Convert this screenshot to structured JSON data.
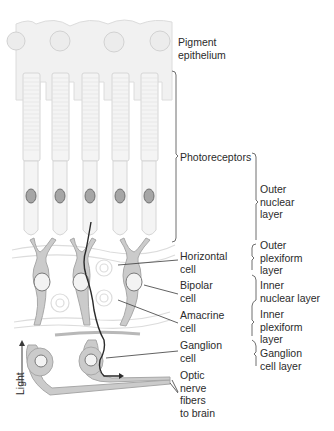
{
  "figure": {
    "type": "retina-cross-section",
    "colors": {
      "cell_fill_light": "#ececec",
      "cell_fill_mid": "#c9c9c9",
      "cell_stroke": "#a8a8a8",
      "nucleus_fill": "#9a9a9a",
      "nucleus_highlight": "#e0e0e0",
      "pathway_line": "#2a2a2a",
      "leader_line": "#3a3a3a",
      "text": "#2b2b2b"
    }
  },
  "cell_labels": {
    "pigment_epithelium": [
      "Pigment",
      "epithelium"
    ],
    "photoreceptors": "Photoreceptors",
    "horizontal_cell": [
      "Horizontal",
      "cell"
    ],
    "bipolar_cell": [
      "Bipolar",
      "cell"
    ],
    "amacrine_cell": [
      "Amacrine",
      "cell"
    ],
    "ganglion_cell": [
      "Ganglion",
      "cell"
    ],
    "optic_nerve": [
      "Optic",
      "nerve",
      "fibers",
      "to brain"
    ]
  },
  "layer_labels": {
    "outer_nuclear": [
      "Outer",
      "nuclear",
      "layer"
    ],
    "outer_plexiform": [
      "Outer",
      "plexiform",
      "layer"
    ],
    "inner_nuclear": [
      "Inner",
      "nuclear layer"
    ],
    "inner_plexiform": [
      "Inner",
      "plexiform",
      "layer"
    ],
    "ganglion_cell_layer": [
      "Ganglion",
      "cell layer"
    ]
  },
  "light_label": "Light"
}
